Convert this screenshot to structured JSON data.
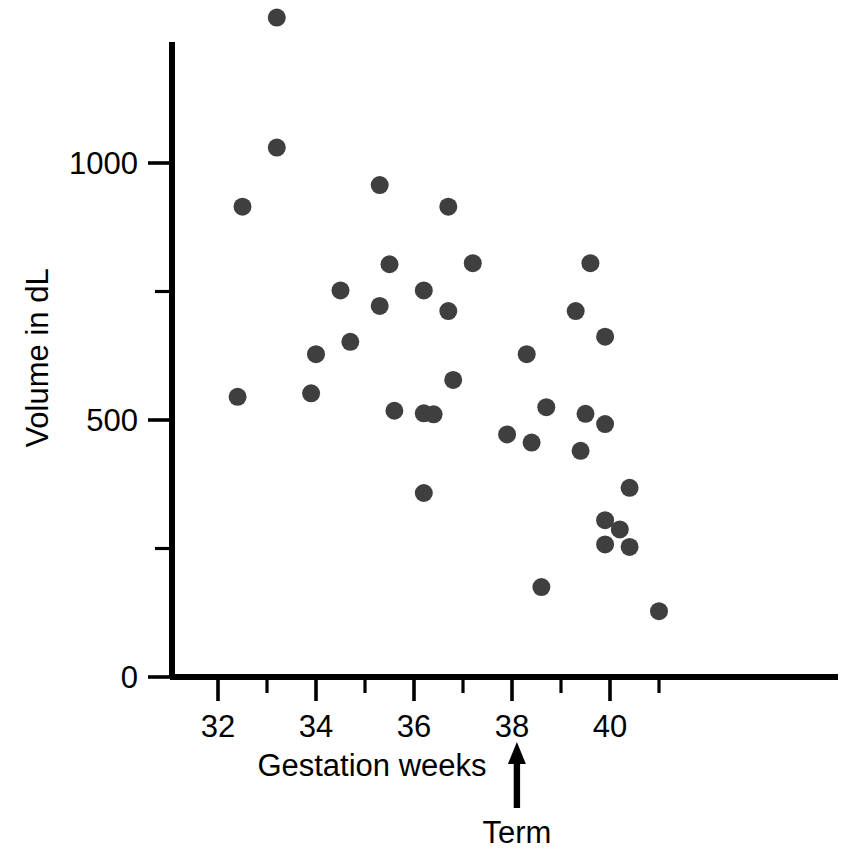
{
  "chart_data": {
    "type": "scatter",
    "title": "",
    "xlabel": "Gestation weeks",
    "ylabel": "Volume in dL",
    "xlim": [
      31.0,
      41.4
    ],
    "ylim": [
      0,
      1300
    ],
    "grid": false,
    "legend": null,
    "marker": {
      "shape": "circle",
      "color": "#3f3f3f",
      "size_px": 18
    },
    "x_ticks_major": [
      32,
      34,
      36,
      38,
      40
    ],
    "x_tick_labels": [
      "32",
      "34",
      "36",
      "38",
      "40"
    ],
    "x_ticks_minor": [
      33,
      35,
      37,
      39,
      41
    ],
    "y_ticks_major": [
      0,
      500,
      1000
    ],
    "y_tick_labels": [
      "0",
      "500",
      "1000"
    ],
    "y_ticks_minor": [
      250,
      750
    ],
    "annotations": [
      {
        "text": "Term",
        "points_to_x": 38.1,
        "arrow": "up"
      }
    ],
    "points": [
      {
        "x": 32.4,
        "y": 545
      },
      {
        "x": 32.5,
        "y": 915
      },
      {
        "x": 33.2,
        "y": 1283
      },
      {
        "x": 33.2,
        "y": 1030
      },
      {
        "x": 33.9,
        "y": 552
      },
      {
        "x": 34.0,
        "y": 628
      },
      {
        "x": 34.5,
        "y": 752
      },
      {
        "x": 34.7,
        "y": 652
      },
      {
        "x": 35.3,
        "y": 957
      },
      {
        "x": 35.3,
        "y": 722
      },
      {
        "x": 35.5,
        "y": 803
      },
      {
        "x": 35.6,
        "y": 518
      },
      {
        "x": 36.2,
        "y": 752
      },
      {
        "x": 36.2,
        "y": 513
      },
      {
        "x": 36.2,
        "y": 358
      },
      {
        "x": 36.4,
        "y": 511
      },
      {
        "x": 36.7,
        "y": 915
      },
      {
        "x": 36.7,
        "y": 712
      },
      {
        "x": 36.8,
        "y": 578
      },
      {
        "x": 37.2,
        "y": 805
      },
      {
        "x": 37.9,
        "y": 472
      },
      {
        "x": 38.3,
        "y": 628
      },
      {
        "x": 38.4,
        "y": 456
      },
      {
        "x": 38.6,
        "y": 175
      },
      {
        "x": 38.7,
        "y": 525
      },
      {
        "x": 39.3,
        "y": 712
      },
      {
        "x": 39.4,
        "y": 440
      },
      {
        "x": 39.5,
        "y": 512
      },
      {
        "x": 39.6,
        "y": 805
      },
      {
        "x": 39.9,
        "y": 662
      },
      {
        "x": 39.9,
        "y": 492
      },
      {
        "x": 39.9,
        "y": 305
      },
      {
        "x": 39.9,
        "y": 258
      },
      {
        "x": 40.2,
        "y": 287
      },
      {
        "x": 40.4,
        "y": 368
      },
      {
        "x": 40.4,
        "y": 253
      },
      {
        "x": 41.0,
        "y": 128
      }
    ]
  },
  "labels": {
    "y_axis_title": "Volume in dL",
    "x_axis_title": "Gestation weeks",
    "term_annotation": "Term"
  }
}
